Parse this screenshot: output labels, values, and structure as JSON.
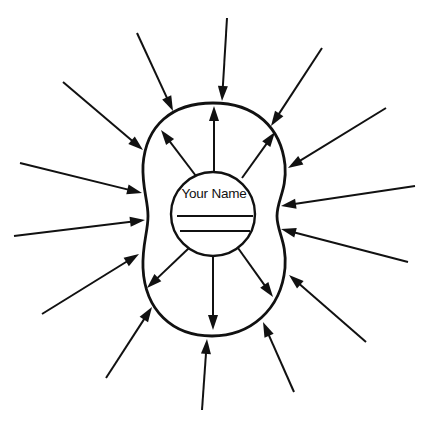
{
  "diagram": {
    "center_label": "Your Name",
    "stroke_color": "#111111",
    "background": "#ffffff",
    "name_lines": [
      {
        "x1": 177,
        "y1": 216,
        "x2": 253,
        "y2": 216
      },
      {
        "x1": 180,
        "y1": 231,
        "x2": 250,
        "y2": 231
      }
    ],
    "inner_circle": {
      "cx": 213,
      "cy": 214,
      "r": 42
    },
    "outer_shape": "boundary blob around center circle",
    "outward_arrows": [
      {
        "x1": 214,
        "y1": 172,
        "x2": 214,
        "y2": 106
      },
      {
        "x1": 196,
        "y1": 176,
        "x2": 161,
        "y2": 130
      },
      {
        "x1": 242,
        "y1": 178,
        "x2": 275,
        "y2": 132
      },
      {
        "x1": 189,
        "y1": 248,
        "x2": 147,
        "y2": 288
      },
      {
        "x1": 213,
        "y1": 256,
        "x2": 213,
        "y2": 330
      },
      {
        "x1": 238,
        "y1": 248,
        "x2": 273,
        "y2": 297
      }
    ],
    "inward_arrows": [
      {
        "x1": 137,
        "y1": 33,
        "x2": 173,
        "y2": 111
      },
      {
        "x1": 63,
        "y1": 82,
        "x2": 143,
        "y2": 150
      },
      {
        "x1": 20,
        "y1": 163,
        "x2": 142,
        "y2": 193
      },
      {
        "x1": 227,
        "y1": 18,
        "x2": 222,
        "y2": 101
      },
      {
        "x1": 322,
        "y1": 48,
        "x2": 271,
        "y2": 126
      },
      {
        "x1": 386,
        "y1": 108,
        "x2": 288,
        "y2": 168
      },
      {
        "x1": 415,
        "y1": 186,
        "x2": 281,
        "y2": 206
      },
      {
        "x1": 14,
        "y1": 236,
        "x2": 145,
        "y2": 220
      },
      {
        "x1": 42,
        "y1": 314,
        "x2": 139,
        "y2": 254
      },
      {
        "x1": 106,
        "y1": 378,
        "x2": 152,
        "y2": 307
      },
      {
        "x1": 202,
        "y1": 410,
        "x2": 207,
        "y2": 339
      },
      {
        "x1": 408,
        "y1": 262,
        "x2": 281,
        "y2": 229
      },
      {
        "x1": 366,
        "y1": 342,
        "x2": 289,
        "y2": 275
      },
      {
        "x1": 294,
        "y1": 392,
        "x2": 263,
        "y2": 322
      }
    ]
  }
}
